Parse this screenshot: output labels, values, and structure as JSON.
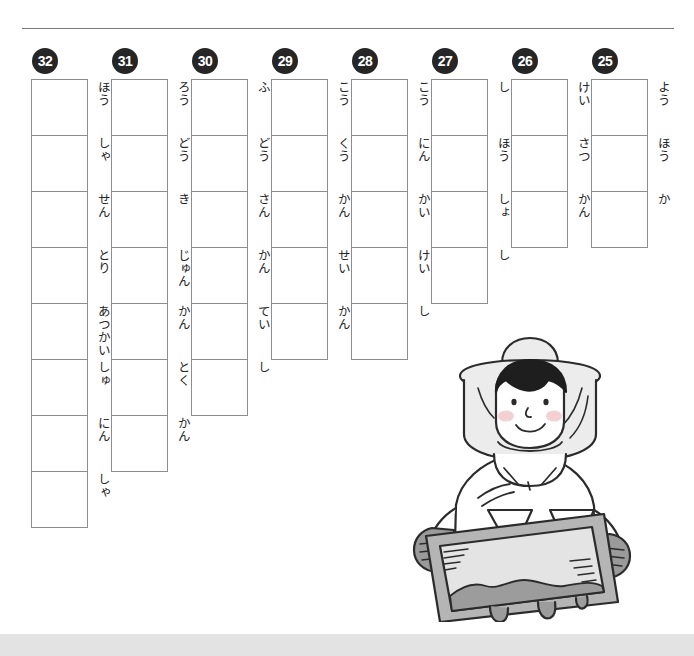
{
  "page": {
    "background_color": "#ffffff",
    "rule_color": "#7b7b7b",
    "footer_bar_color": "#e3e3e3",
    "box_border_color": "#8d8d8d",
    "number_badge_color": "#262626",
    "text_color": "#242424"
  },
  "columns": [
    {
      "number": "32",
      "readings": [
        "ほう",
        "しゃ",
        "せん",
        "とり",
        "あつかい",
        "しゅ",
        "にん",
        "しゃ"
      ]
    },
    {
      "number": "31",
      "readings": [
        "ろう",
        "どう",
        "き",
        "じゅん",
        "かん",
        "とく",
        "かん"
      ]
    },
    {
      "number": "30",
      "readings": [
        "ふ",
        "どう",
        "さん",
        "かん",
        "てい",
        "し"
      ]
    },
    {
      "number": "29",
      "readings": [
        "こう",
        "くう",
        "かん",
        "せい",
        "かん"
      ]
    },
    {
      "number": "28",
      "readings": [
        "こう",
        "にん",
        "かい",
        "けい",
        "し"
      ]
    },
    {
      "number": "27",
      "readings": [
        "し",
        "ほう",
        "しょ",
        "し"
      ]
    },
    {
      "number": "26",
      "readings": [
        "けい",
        "さつ",
        "かん"
      ]
    },
    {
      "number": "25",
      "readings": [
        "よう",
        "ほう",
        "か"
      ]
    }
  ],
  "illustration": {
    "name": "beekeeper-holding-honeycomb-frame",
    "description": "Beekeeper in white protective suit and veiled hat holding a honeycomb frame dripping with honey",
    "colors": {
      "outline": "#2b2b2b",
      "suit": "#ffffff",
      "veil": "#ececec",
      "hair": "#1e1e1e",
      "cheek": "#f0c8cc",
      "glove": "#9a9a9a",
      "frame": "#b5b5b5",
      "comb": "#e4e4e4",
      "honey": "#9c9c9c"
    }
  }
}
